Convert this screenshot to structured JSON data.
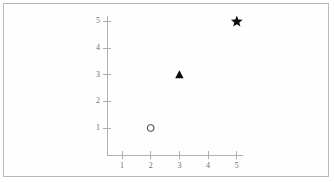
{
  "chart_data": {
    "type": "scatter",
    "title": "",
    "subtitle": "",
    "xlabel": "",
    "ylabel": "",
    "xlim": [
      0,
      5.4
    ],
    "ylim": [
      0,
      5.4
    ],
    "x_ticks": [
      1,
      2,
      3,
      4,
      5
    ],
    "y_ticks": [
      1,
      2,
      3,
      4,
      5
    ],
    "x_tick_labels": [
      "1",
      "2",
      "3",
      "4",
      "5"
    ],
    "y_tick_labels": [
      "1",
      "2",
      "3",
      "4",
      "5"
    ],
    "grid": false,
    "legend": "none",
    "axis_color": "#b0b0b0",
    "label_color": "#6e6e6e",
    "marker_color": "#0d0d0d",
    "background": "#fefefe",
    "border_color": "#b8b8b8",
    "points": [
      {
        "x": 2,
        "y": 1,
        "marker": "circle-open",
        "label": ""
      },
      {
        "x": 3,
        "y": 3,
        "marker": "triangle-filled",
        "label": ""
      },
      {
        "x": 5,
        "y": 5,
        "marker": "star-filled",
        "label": ""
      }
    ]
  }
}
